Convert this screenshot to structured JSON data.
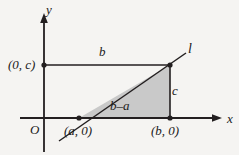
{
  "figure": {
    "background_color": "#f5f4f2",
    "stroke_color": "#231f20",
    "triangle_fill": "#c9c9c9"
  },
  "axes": {
    "x_label": "x",
    "y_label": "y",
    "origin_label": "O"
  },
  "line": {
    "label": "l"
  },
  "points": [
    {
      "name": "y-intercept",
      "label": "(0, c)"
    },
    {
      "name": "x-intercept",
      "label": "(a, 0)"
    },
    {
      "name": "foot-point",
      "label": "(b, 0)"
    }
  ],
  "segments": [
    {
      "name": "top-horizontal",
      "label": "b"
    },
    {
      "name": "right-vertical",
      "label": "c"
    },
    {
      "name": "triangle-base",
      "label": "b–a"
    }
  ],
  "geometry": {
    "x_axis_y": 118,
    "y_axis_x": 44,
    "point_a_x": 79,
    "point_b_x": 170,
    "rect_top_y": 65,
    "x_arrow_tip_x": 222,
    "y_arrow_tip_y": 13,
    "line_end_x": 186,
    "line_end_y": 53,
    "line_start_x": 59,
    "line_start_y": 141
  }
}
